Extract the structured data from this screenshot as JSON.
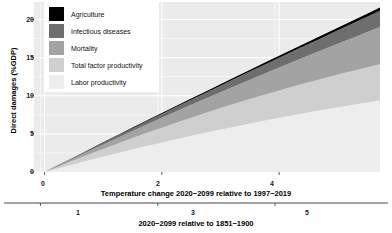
{
  "chart_data": {
    "type": "area",
    "stacked": true,
    "title": "",
    "subtitle": "",
    "xlabel": "Temperature change 2020−2099 relative to 1997−2019",
    "xlabel_secondary": "2020−2099 relative to 1851−1900",
    "ylabel": "Direct damages (%GDP)",
    "xlim": [
      -0.18,
      5.72
    ],
    "ylim": [
      0,
      22.3
    ],
    "xticks": [
      0,
      2,
      4
    ],
    "xticklabels": [
      "0",
      "2",
      "4"
    ],
    "xticks_secondary": [
      1,
      3,
      5
    ],
    "xticklabels_secondary": [
      "1",
      "3",
      "5"
    ],
    "secondary_axis_offset": 1.07,
    "yticks": [
      0,
      5,
      10,
      15,
      20
    ],
    "yticklabels": [
      "0",
      "5",
      "10",
      "15",
      "20"
    ],
    "grid": true,
    "grid_color": "#ffffff",
    "panel_background": "#ebebeb",
    "legend_position": "top-left-inside",
    "x": [
      0,
      0.25,
      0.5,
      0.75,
      1.0,
      1.25,
      1.5,
      1.75,
      2.0,
      2.25,
      2.5,
      2.75,
      3.0,
      3.25,
      3.5,
      3.75,
      4.0,
      4.25,
      4.5,
      4.75,
      5.0,
      5.25,
      5.5,
      5.72
    ],
    "series": [
      {
        "name": "Labor productivity",
        "color": "#ededed",
        "values": [
          0,
          0.52,
          1.03,
          1.53,
          2.02,
          2.5,
          2.97,
          3.43,
          3.88,
          4.32,
          4.75,
          5.17,
          5.58,
          5.98,
          6.37,
          6.75,
          7.12,
          7.48,
          7.83,
          8.17,
          8.5,
          8.82,
          9.13,
          9.4
        ]
      },
      {
        "name": "Total factor productivity",
        "color": "#cfcfcf",
        "values": [
          0,
          0.25,
          0.5,
          0.75,
          1.0,
          1.24,
          1.48,
          1.71,
          1.94,
          2.16,
          2.38,
          2.59,
          2.8,
          3.0,
          3.2,
          3.39,
          3.58,
          3.76,
          3.94,
          4.11,
          4.28,
          4.44,
          4.6,
          4.74
        ]
      },
      {
        "name": "Mortality",
        "color": "#a3a3a3",
        "values": [
          0,
          0.14,
          0.29,
          0.44,
          0.6,
          0.76,
          0.93,
          1.11,
          1.29,
          1.48,
          1.68,
          1.88,
          2.09,
          2.31,
          2.54,
          2.77,
          3.01,
          3.26,
          3.52,
          3.78,
          4.05,
          4.33,
          4.62,
          4.88
        ]
      },
      {
        "name": "Infectious diseases",
        "color": "#6e6e6e",
        "values": [
          0,
          0.05,
          0.1,
          0.16,
          0.22,
          0.29,
          0.36,
          0.43,
          0.51,
          0.59,
          0.68,
          0.77,
          0.86,
          0.96,
          1.06,
          1.17,
          1.28,
          1.39,
          1.51,
          1.63,
          1.76,
          1.89,
          2.02,
          2.14
        ]
      },
      {
        "name": "Agriculture",
        "color": "#000000",
        "values": [
          0,
          0.012,
          0.025,
          0.038,
          0.052,
          0.066,
          0.081,
          0.096,
          0.112,
          0.128,
          0.145,
          0.162,
          0.18,
          0.198,
          0.217,
          0.236,
          0.256,
          0.276,
          0.297,
          0.318,
          0.34,
          0.362,
          0.385,
          0.405
        ]
      }
    ],
    "legend_entries": [
      {
        "label": "Agriculture",
        "color": "#000000"
      },
      {
        "label": "Infectious diseases",
        "color": "#6e6e6e"
      },
      {
        "label": "Mortality",
        "color": "#a3a3a3"
      },
      {
        "label": "Total factor productivity",
        "color": "#cfcfcf"
      },
      {
        "label": "Labor productivity",
        "color": "#ededed"
      }
    ]
  }
}
